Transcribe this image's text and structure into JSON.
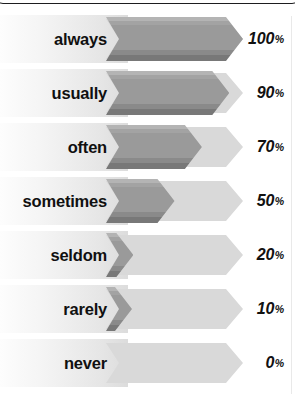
{
  "chart_data": {
    "type": "bar",
    "title": "",
    "subtitle": "",
    "xlabel": "",
    "ylabel": "",
    "xlim": [
      0,
      100
    ],
    "grid": false,
    "legend": null,
    "orientation": "horizontal",
    "value_suffix": "%",
    "categories": [
      "always",
      "usually",
      "often",
      "sometimes",
      "seldom",
      "rarely",
      "never"
    ],
    "values": [
      100,
      90,
      70,
      50,
      20,
      10,
      0
    ],
    "value_labels": [
      "100",
      "90",
      "70",
      "50",
      "20",
      "10",
      "0"
    ],
    "rows": [
      {
        "label": "always",
        "value": 100,
        "value_label": "100",
        "suffix": "%"
      },
      {
        "label": "usually",
        "value": 90,
        "value_label": "90",
        "suffix": "%"
      },
      {
        "label": "often",
        "value": 70,
        "value_label": "70",
        "suffix": "%"
      },
      {
        "label": "sometimes",
        "value": 50,
        "value_label": "50",
        "suffix": "%"
      },
      {
        "label": "seldom",
        "value": 20,
        "value_label": "20",
        "suffix": "%"
      },
      {
        "label": "rarely",
        "value": 10,
        "value_label": "10",
        "suffix": "%"
      },
      {
        "label": "never",
        "value": 0,
        "value_label": "0",
        "suffix": "%"
      }
    ],
    "colors": {
      "bar_fill": "#9a9a9a",
      "bar_highlight": "#b4b4b4",
      "bar_shadow": "#787878",
      "track": "#d9d9d9",
      "label_plate_start": "#fdfdfd",
      "label_plate_end": "#dcdcdc",
      "text": "#101010",
      "frame_line": "#1d1d1f",
      "background": "#ffffff"
    }
  }
}
